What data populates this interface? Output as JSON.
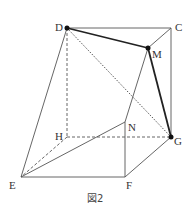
{
  "figure": {
    "caption": "図2",
    "points": {
      "D": {
        "label": "D",
        "x": 67,
        "y": 28
      },
      "C": {
        "label": "C",
        "x": 171,
        "y": 28
      },
      "M": {
        "label": "M",
        "x": 148,
        "y": 48
      },
      "G": {
        "label": "G",
        "x": 171,
        "y": 137
      },
      "H": {
        "label": "H",
        "x": 67,
        "y": 137
      },
      "N": {
        "label": "N",
        "x": 125,
        "y": 122
      },
      "E": {
        "label": "E",
        "x": 21,
        "y": 177
      },
      "F": {
        "label": "F",
        "x": 125,
        "y": 177
      }
    },
    "solid_edges": [
      [
        "D",
        "C"
      ],
      [
        "C",
        "G"
      ],
      [
        "C",
        "M"
      ],
      [
        "D",
        "E"
      ],
      [
        "E",
        "F"
      ],
      [
        "F",
        "G"
      ],
      [
        "F",
        "N"
      ],
      [
        "E",
        "N"
      ],
      [
        "N",
        "M"
      ]
    ],
    "bold_edges": [
      [
        "D",
        "M"
      ],
      [
        "M",
        "G"
      ]
    ],
    "dashed_edges": [
      [
        "D",
        "H"
      ],
      [
        "H",
        "G"
      ],
      [
        "H",
        "E"
      ]
    ],
    "dotted_edges": [
      [
        "D",
        "G"
      ]
    ],
    "marked_points": [
      "D",
      "M",
      "G"
    ],
    "colors": {
      "line": "#555555",
      "bold": "#222222",
      "dot": "#111111"
    }
  }
}
